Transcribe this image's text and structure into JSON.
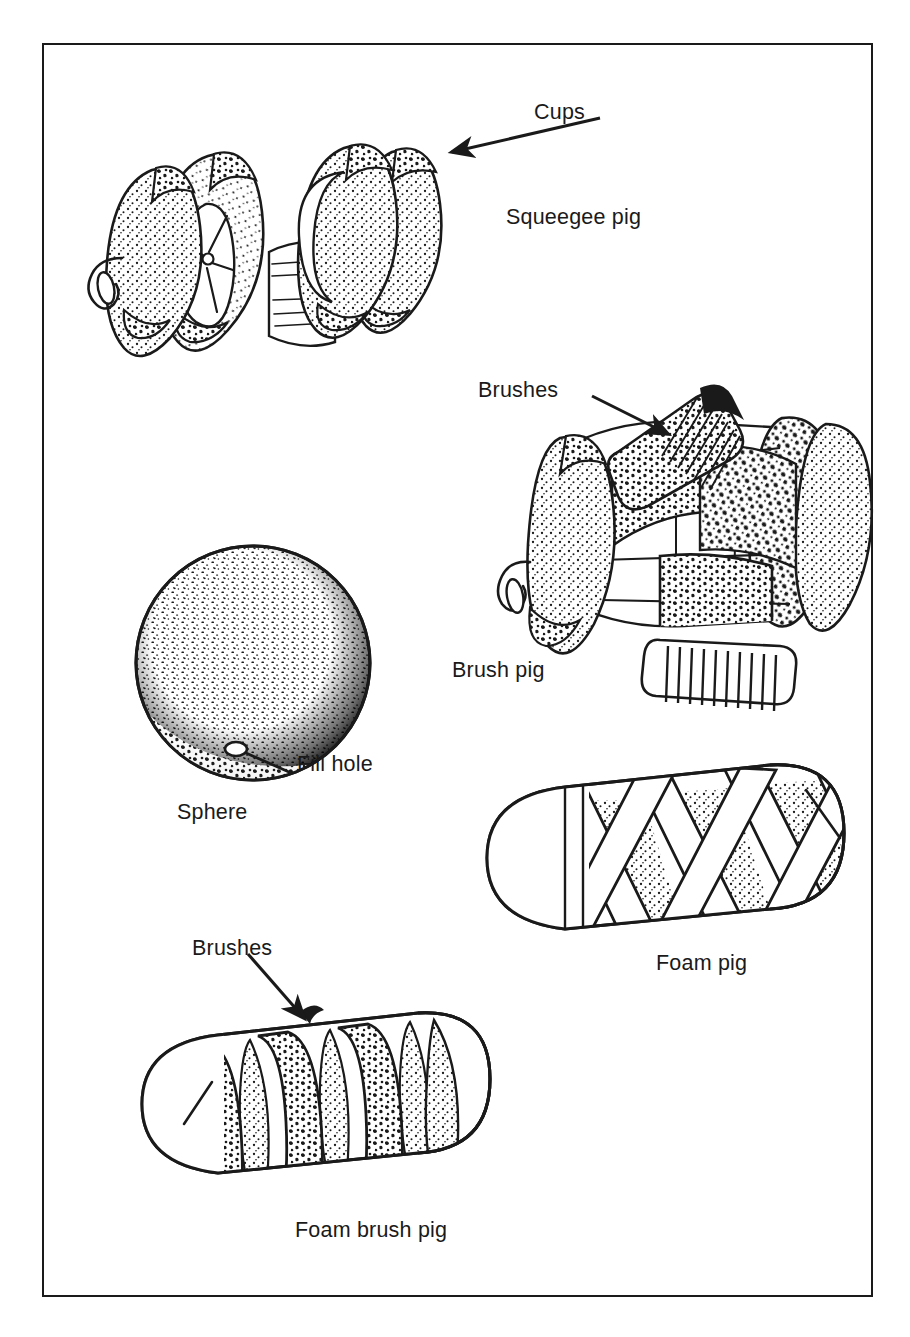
{
  "figure": {
    "kind": "technical-line-illustration",
    "border_color": "#1a1a1a",
    "ink_color": "#1a1a1a",
    "background_color": "#ffffff"
  },
  "callouts": [
    {
      "id": "cups",
      "text": "Cups",
      "x": 534,
      "y": 100,
      "arrow": "points down-left to outer cup disc of squeegee pig"
    },
    {
      "id": "brushes-top",
      "text": "Brushes",
      "x": 478,
      "y": 378,
      "arrow": "points down-right to brush block of brush pig"
    },
    {
      "id": "fill-hole",
      "text": "Fill hole",
      "x": 297,
      "y": 752,
      "arrow": "leader line to small hole at lower edge of sphere"
    },
    {
      "id": "brushes-bottom",
      "text": "Brushes",
      "x": 192,
      "y": 936,
      "arrow": "points down-right to brush band of foam brush pig"
    }
  ],
  "captions": [
    {
      "id": "squeegee-pig",
      "text": "Squeegee pig",
      "x": 506,
      "y": 205
    },
    {
      "id": "brush-pig",
      "text": "Brush pig",
      "x": 452,
      "y": 658
    },
    {
      "id": "sphere",
      "text": "Sphere",
      "x": 177,
      "y": 800
    },
    {
      "id": "foam-pig",
      "text": "Foam pig",
      "x": 656,
      "y": 951
    },
    {
      "id": "foam-brush-pig",
      "text": "Foam brush pig",
      "x": 295,
      "y": 1218
    }
  ],
  "objects": [
    {
      "id": "squeegee-pig",
      "name": "Squeegee pig",
      "description": "Mandrel with four stippled sealing cup discs and a towing eye at the nose",
      "cup_count": 4,
      "has_towing_eye": true,
      "center": {
        "x": 285,
        "y": 240
      }
    },
    {
      "id": "brush-pig",
      "name": "Brush pig",
      "description": "Body with end cup discs and radial wire brush blocks between them",
      "brush_block_count": 3,
      "has_towing_eye": true,
      "center": {
        "x": 672,
        "y": 545
      }
    },
    {
      "id": "sphere",
      "name": "Sphere",
      "description": "Inflatable sphere with a fill hole on its lower surface",
      "has_fill_hole": true,
      "center": {
        "x": 253,
        "y": 663
      },
      "radius": 117
    },
    {
      "id": "foam-pig",
      "name": "Foam pig",
      "description": "Bullet-nosed foam cylinder wrapped with criss-cross helical straps",
      "strap_style": "smooth criss-cross bands",
      "center": {
        "x": 655,
        "y": 860
      }
    },
    {
      "id": "foam-brush-pig",
      "name": "Foam brush pig",
      "description": "Bullet-nosed foam cylinder wrapped with coarse helical brush bands",
      "strap_style": "coarse brush bands",
      "center": {
        "x": 310,
        "y": 1105
      }
    }
  ]
}
